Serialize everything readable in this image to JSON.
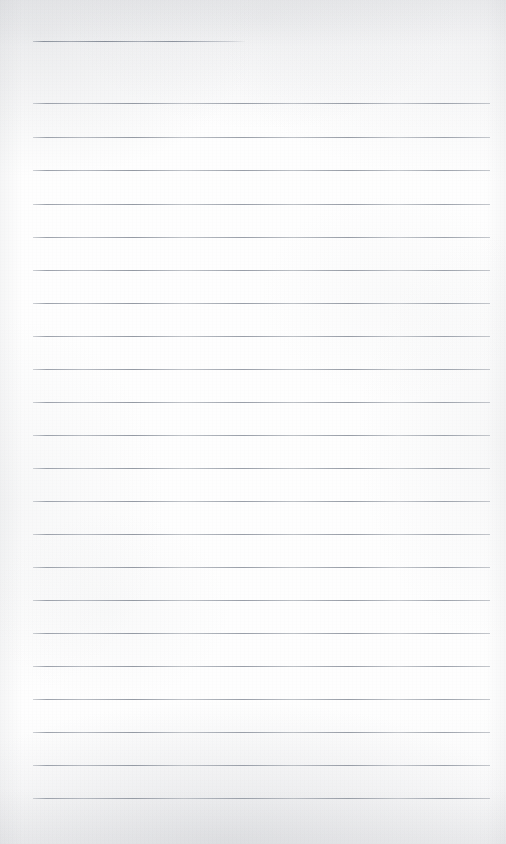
{
  "document": {
    "kind": "lined-paper-scan",
    "title": "Blank ruled notebook page",
    "description": "Scanned sheet of blank lined writing paper with horizontal rules and no handwriting or printed text",
    "page_width": 506,
    "page_height": 844,
    "visible_text": "",
    "colors": {
      "paper": "#fdfdfd",
      "paper_shadow": "#f2f3f4",
      "rule_line": "#a9aeb6",
      "rule_line_dark": "#8d939e"
    },
    "ruling": {
      "count": 24,
      "left_x": 33,
      "right_x": 490,
      "spacing": 33,
      "thickness": 1,
      "first_line_is_truncated": true,
      "first_line_right_x": 245,
      "lines": [
        {
          "y": 41,
          "left": 33,
          "right": 245,
          "short": true
        },
        {
          "y": 103,
          "left": 33,
          "right": 490,
          "short": false
        },
        {
          "y": 137,
          "left": 33,
          "right": 490,
          "short": false
        },
        {
          "y": 170,
          "left": 33,
          "right": 490,
          "short": false
        },
        {
          "y": 204,
          "left": 33,
          "right": 490,
          "short": false
        },
        {
          "y": 237,
          "left": 33,
          "right": 490,
          "short": false
        },
        {
          "y": 270,
          "left": 33,
          "right": 490,
          "short": false
        },
        {
          "y": 303,
          "left": 33,
          "right": 490,
          "short": false
        },
        {
          "y": 336,
          "left": 33,
          "right": 490,
          "short": false
        },
        {
          "y": 369,
          "left": 33,
          "right": 490,
          "short": false
        },
        {
          "y": 402,
          "left": 33,
          "right": 490,
          "short": false
        },
        {
          "y": 435,
          "left": 33,
          "right": 490,
          "short": false
        },
        {
          "y": 468,
          "left": 33,
          "right": 490,
          "short": false
        },
        {
          "y": 501,
          "left": 33,
          "right": 490,
          "short": false
        },
        {
          "y": 534,
          "left": 33,
          "right": 490,
          "short": false
        },
        {
          "y": 567,
          "left": 33,
          "right": 490,
          "short": false
        },
        {
          "y": 600,
          "left": 33,
          "right": 490,
          "short": false
        },
        {
          "y": 633,
          "left": 33,
          "right": 490,
          "short": false
        },
        {
          "y": 666,
          "left": 33,
          "right": 490,
          "short": false
        },
        {
          "y": 699,
          "left": 33,
          "right": 490,
          "short": false
        },
        {
          "y": 732,
          "left": 33,
          "right": 490,
          "short": false
        },
        {
          "y": 765,
          "left": 33,
          "right": 490,
          "short": false
        },
        {
          "y": 798,
          "left": 33,
          "right": 490,
          "short": false
        }
      ]
    }
  }
}
